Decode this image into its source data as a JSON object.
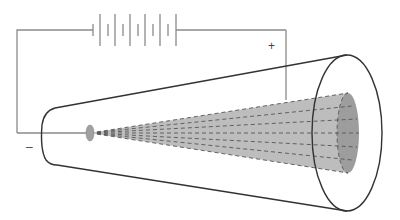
{
  "diagram": {
    "labels": {
      "positive": "+",
      "negative": "–"
    },
    "colors": {
      "wire": "#8a8a8a",
      "tube_outline": "#333333",
      "beam_fill": "#b8b8b8",
      "beam_end_fill": "#9a9a9a",
      "beam_dash": "#555555",
      "cathode": "#a0a0a0"
    },
    "components": [
      "battery",
      "wires",
      "cathode",
      "tube",
      "electron-beam",
      "screen"
    ]
  }
}
